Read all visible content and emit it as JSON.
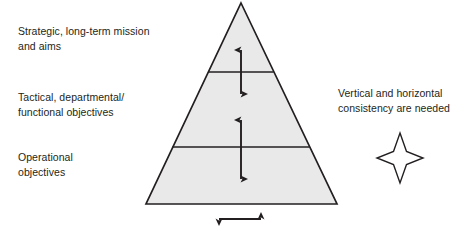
{
  "diagram": {
    "colors": {
      "pyramid_fill": "#e9e9e9",
      "pyramid_stroke": "#231f20",
      "text": "#231f20",
      "background": "#ffffff",
      "star_stroke": "#231f20"
    },
    "labels": {
      "strategic": "Strategic, long-term mission\nand aims",
      "tactical": "Tactical, departmental/\nfunctional objectives",
      "operational": "Operational\nobjectives",
      "consistency": "Vertical and horizontal\nconsistency are needed"
    },
    "shapes": {
      "pyramid": {
        "apex": [
          241,
          3
        ],
        "base_left": [
          146,
          204
        ],
        "base_right": [
          337,
          204
        ],
        "divider_1_y": 72,
        "divider_2_y": 147
      },
      "arrows": {
        "upper_vertical": {
          "x": 241,
          "y_top": 48,
          "y_bottom": 95
        },
        "lower_vertical": {
          "x": 241,
          "y_top": 118,
          "y_bottom": 180
        },
        "bottom_horizontal": {
          "y": 219,
          "x_left": 217,
          "x_right": 263
        }
      },
      "star": {
        "center": [
          400,
          158
        ],
        "outer_radius_x": 23,
        "outer_radius_y": 25
      }
    }
  }
}
